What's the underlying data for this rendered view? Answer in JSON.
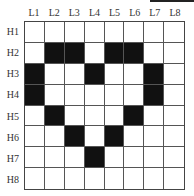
{
  "figure": {
    "columns": [
      "L1",
      "L2",
      "L3",
      "L4",
      "L5",
      "L6",
      "L7",
      "L8"
    ],
    "rows": [
      "H1",
      "H2",
      "H3",
      "H4",
      "H5",
      "H6",
      "H7",
      "H8"
    ],
    "grid": [
      [
        0,
        0,
        0,
        0,
        0,
        0,
        0,
        0
      ],
      [
        0,
        1,
        1,
        0,
        1,
        1,
        0,
        0
      ],
      [
        1,
        0,
        0,
        1,
        0,
        0,
        1,
        0
      ],
      [
        1,
        0,
        0,
        0,
        0,
        0,
        1,
        0
      ],
      [
        0,
        1,
        0,
        0,
        0,
        1,
        0,
        0
      ],
      [
        0,
        0,
        1,
        0,
        1,
        0,
        0,
        0
      ],
      [
        0,
        0,
        0,
        1,
        0,
        0,
        0,
        0
      ],
      [
        0,
        0,
        0,
        0,
        0,
        0,
        0,
        0
      ]
    ],
    "colors": {
      "filled": "#111111",
      "empty": "#ffffff"
    },
    "shape": "heart"
  }
}
